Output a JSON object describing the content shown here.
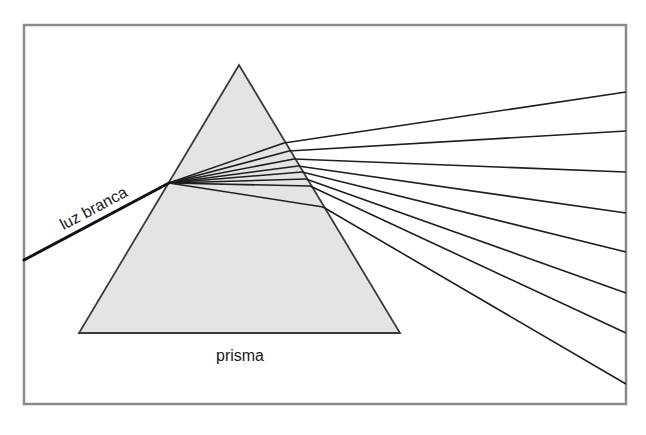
{
  "diagram": {
    "labels": {
      "incident_light": "luz branca",
      "prism": "prisma"
    },
    "colors": {
      "frame": "#8a8a8a",
      "prism_fill": "#e4e4e4",
      "prism_stroke": "#3a3a3a",
      "ray": "#1e1e1e",
      "incident_ray": "#111111",
      "text": "#1a1a1a"
    },
    "frame": {
      "x": 24,
      "y": 25,
      "width": 602,
      "height": 379
    },
    "prism": {
      "apex": [
        239,
        65
      ],
      "base_left": [
        79,
        333
      ],
      "base_right": [
        400,
        333
      ]
    },
    "incident_ray": {
      "start": [
        24,
        260
      ],
      "end": [
        169,
        183
      ]
    },
    "dispersion_origin": [
      169,
      183
    ],
    "refracted_rays": [
      {
        "exit": [
          284,
          143
        ],
        "end": [
          626,
          92
        ]
      },
      {
        "exit": [
          289,
          151
        ],
        "end": [
          626,
          131
        ]
      },
      {
        "exit": [
          294,
          159
        ],
        "end": [
          626,
          172
        ]
      },
      {
        "exit": [
          298,
          166
        ],
        "end": [
          626,
          213
        ]
      },
      {
        "exit": [
          302,
          172
        ],
        "end": [
          626,
          252
        ]
      },
      {
        "exit": [
          306,
          179
        ],
        "end": [
          626,
          293
        ]
      },
      {
        "exit": [
          310,
          186
        ],
        "end": [
          626,
          333
        ]
      },
      {
        "exit": [
          323,
          207
        ],
        "end": [
          626,
          384
        ]
      }
    ]
  }
}
